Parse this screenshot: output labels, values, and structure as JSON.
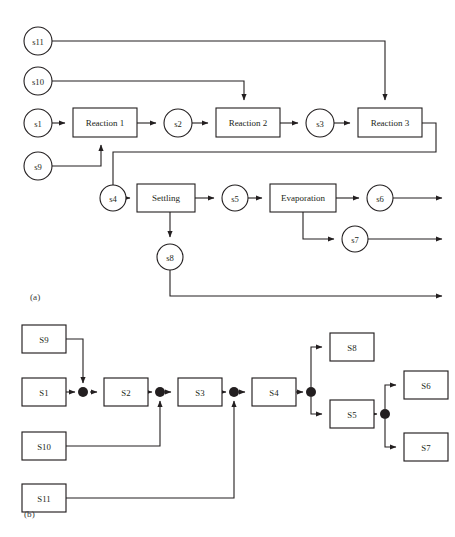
{
  "figure": {
    "background_color": "#ffffff",
    "line_color": "#231f20",
    "node_fill": "#ffffff",
    "panels": [
      {
        "id": "a",
        "caption": "(a)",
        "type": "process-flowsheet",
        "description": "Chemical process flowsheet with circular stream nodes and rectangular unit-operation blocks"
      },
      {
        "id": "b",
        "caption": "(b)",
        "type": "stream-graph",
        "description": "Equivalent stream graph with rectangular stream nodes and filled junction dots"
      }
    ]
  },
  "panel_a": {
    "caption": "(a)",
    "streams": [
      {
        "id": "s11",
        "label": "s11",
        "cx": 38,
        "cy": 41,
        "r": 14
      },
      {
        "id": "s10",
        "label": "s10",
        "cx": 38,
        "cy": 81,
        "r": 14
      },
      {
        "id": "s1",
        "label": "s1",
        "cx": 38,
        "cy": 123,
        "r": 14
      },
      {
        "id": "s9",
        "label": "s9",
        "cx": 38,
        "cy": 166,
        "r": 14
      },
      {
        "id": "s2",
        "label": "s2",
        "cx": 178,
        "cy": 123,
        "r": 14
      },
      {
        "id": "s3",
        "label": "s3",
        "cx": 320,
        "cy": 123,
        "r": 14
      },
      {
        "id": "s4",
        "label": "s4",
        "cx": 113,
        "cy": 198,
        "r": 13
      },
      {
        "id": "s5",
        "label": "s5",
        "cx": 235,
        "cy": 198,
        "r": 13
      },
      {
        "id": "s6",
        "label": "s6",
        "cx": 380,
        "cy": 198,
        "r": 13
      },
      {
        "id": "s7",
        "label": "s7",
        "cx": 355,
        "cy": 239,
        "r": 13
      },
      {
        "id": "s8",
        "label": "s8",
        "cx": 170,
        "cy": 257,
        "r": 13
      }
    ],
    "units": [
      {
        "id": "reaction1",
        "label": "Reaction 1",
        "x": 73,
        "y": 108,
        "w": 64,
        "h": 29
      },
      {
        "id": "reaction2",
        "label": "Reaction 2",
        "x": 216,
        "y": 108,
        "w": 64,
        "h": 29
      },
      {
        "id": "reaction3",
        "label": "Reaction 3",
        "x": 358,
        "y": 108,
        "w": 64,
        "h": 29
      },
      {
        "id": "settling",
        "label": "Settling",
        "x": 137,
        "y": 184,
        "w": 58,
        "h": 28
      },
      {
        "id": "evaporation",
        "label": "Evaporation",
        "x": 270,
        "y": 184,
        "w": 66,
        "h": 28
      }
    ],
    "connections": [
      {
        "from": "s1",
        "to": "reaction1"
      },
      {
        "from": "reaction1",
        "to": "s2"
      },
      {
        "from": "s2",
        "to": "reaction2"
      },
      {
        "from": "reaction2",
        "to": "s3"
      },
      {
        "from": "s3",
        "to": "reaction3"
      },
      {
        "from": "s10",
        "to": "reaction2"
      },
      {
        "from": "s11",
        "to": "reaction3"
      },
      {
        "from": "s9",
        "to": "reaction1"
      },
      {
        "from": "reaction3",
        "to": "s4"
      },
      {
        "from": "s4",
        "to": "settling"
      },
      {
        "from": "settling",
        "to": "s5"
      },
      {
        "from": "settling",
        "to": "s8"
      },
      {
        "from": "s5",
        "to": "evaporation"
      },
      {
        "from": "evaporation",
        "to": "s6"
      },
      {
        "from": "evaporation",
        "to": "s7"
      },
      {
        "from": "s6",
        "to": "outlet"
      },
      {
        "from": "s7",
        "to": "outlet"
      },
      {
        "from": "s8",
        "to": "outlet"
      }
    ]
  },
  "panel_b": {
    "caption": "(b)",
    "nodes": [
      {
        "id": "S9",
        "label": "S9",
        "x": 22,
        "y": 325,
        "w": 44,
        "h": 28
      },
      {
        "id": "S1",
        "label": "S1",
        "x": 22,
        "y": 378,
        "w": 44,
        "h": 28
      },
      {
        "id": "S2",
        "label": "S2",
        "x": 104,
        "y": 378,
        "w": 44,
        "h": 28
      },
      {
        "id": "S3",
        "label": "S3",
        "x": 178,
        "y": 378,
        "w": 44,
        "h": 28
      },
      {
        "id": "S4",
        "label": "S4",
        "x": 252,
        "y": 378,
        "w": 44,
        "h": 28
      },
      {
        "id": "S10",
        "label": "S10",
        "x": 22,
        "y": 432,
        "w": 44,
        "h": 28
      },
      {
        "id": "S11",
        "label": "S11",
        "x": 22,
        "y": 484,
        "w": 44,
        "h": 28
      },
      {
        "id": "S8",
        "label": "S8",
        "x": 330,
        "y": 333,
        "w": 44,
        "h": 28
      },
      {
        "id": "S5",
        "label": "S5",
        "x": 330,
        "y": 400,
        "w": 44,
        "h": 28
      },
      {
        "id": "S6",
        "label": "S6",
        "x": 404,
        "y": 371,
        "w": 44,
        "h": 28
      },
      {
        "id": "S7",
        "label": "S7",
        "x": 404,
        "y": 433,
        "w": 44,
        "h": 28
      }
    ],
    "junctions": [
      {
        "id": "j1",
        "cx": 83,
        "cy": 392,
        "r": 5
      },
      {
        "id": "j2",
        "cx": 160,
        "cy": 392,
        "r": 5
      },
      {
        "id": "j3",
        "cx": 234,
        "cy": 392,
        "r": 5
      },
      {
        "id": "j4",
        "cx": 311,
        "cy": 392,
        "r": 5
      },
      {
        "id": "j5",
        "cx": 385,
        "cy": 414,
        "r": 5
      }
    ],
    "edges": [
      {
        "from": "S1",
        "to": "j1"
      },
      {
        "from": "S9",
        "to": "j1"
      },
      {
        "from": "j1",
        "to": "S2"
      },
      {
        "from": "S2",
        "to": "j2"
      },
      {
        "from": "S10",
        "to": "j2"
      },
      {
        "from": "j2",
        "to": "S3"
      },
      {
        "from": "S3",
        "to": "j3"
      },
      {
        "from": "S11",
        "to": "j3"
      },
      {
        "from": "j3",
        "to": "S4"
      },
      {
        "from": "S4",
        "to": "j4"
      },
      {
        "from": "j4",
        "to": "S8"
      },
      {
        "from": "j4",
        "to": "S5"
      },
      {
        "from": "S5",
        "to": "j5"
      },
      {
        "from": "j5",
        "to": "S6"
      },
      {
        "from": "j5",
        "to": "S7"
      }
    ]
  }
}
